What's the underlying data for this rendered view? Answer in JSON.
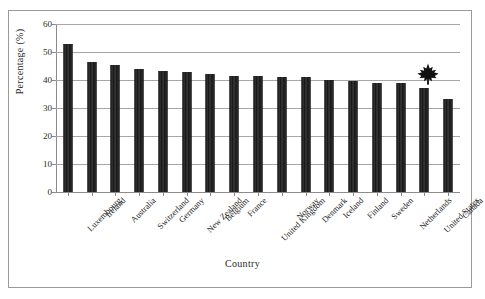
{
  "chart_data": {
    "type": "bar",
    "title": "",
    "xlabel": "Country",
    "ylabel": "Percentage (%)",
    "ylim": [
      0,
      60
    ],
    "yticks": [
      0,
      10,
      20,
      30,
      40,
      50,
      60
    ],
    "grid": true,
    "legend": "none",
    "bar_color": "#1c1c1c",
    "categories": [
      "Luxembourg",
      "Ireland",
      "Australia",
      "Switzerland",
      "Germany",
      "New Zealand",
      "Belgium",
      "France",
      "United Kingdom",
      "Norway",
      "Denmark",
      "Iceland",
      "Finland",
      "Sweden",
      "Netherlands",
      "United States",
      "Canada"
    ],
    "values": [
      52.9,
      46.6,
      45.5,
      44.0,
      43.2,
      43.0,
      42.3,
      41.6,
      41.3,
      41.1,
      40.9,
      40.0,
      39.6,
      39.1,
      38.8,
      37.1,
      33.2
    ],
    "annotations": [
      {
        "name": "maple-leaf-marker",
        "icon": "maple-leaf-icon",
        "attached_to": "Canada",
        "color": "#111111"
      }
    ]
  },
  "axes": {
    "y_tick_labels": [
      "60",
      "50",
      "40",
      "30",
      "20",
      "10",
      "0"
    ],
    "y_title": "Percentage (%)",
    "x_title": "Country"
  },
  "icons": {
    "maple_leaf": "maple-leaf-icon"
  }
}
